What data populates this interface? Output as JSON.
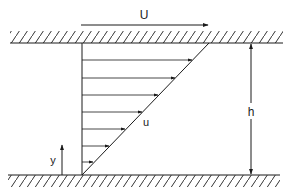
{
  "diagram": {
    "labels": {
      "plate_velocity": "U",
      "velocity_profile": "u",
      "gap_height": "h",
      "y_axis": "y"
    },
    "colors": {
      "stroke": "#1a1a1a",
      "background": "#ffffff"
    },
    "profile": {
      "arrow_count": 7,
      "shape": "linear"
    }
  }
}
